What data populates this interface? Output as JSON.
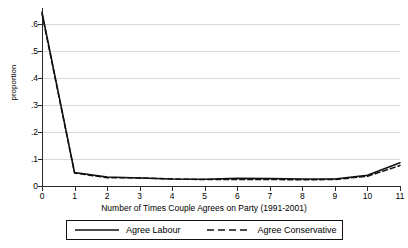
{
  "chart_data": {
    "type": "line",
    "title": "",
    "xlabel": "Number of Times Couple Agrees on Party (1991-2001)",
    "ylabel": "proportion",
    "x": [
      0,
      1,
      2,
      3,
      4,
      5,
      6,
      7,
      8,
      9,
      10,
      11
    ],
    "xlim": [
      0,
      11
    ],
    "ylim": [
      0,
      0.66
    ],
    "xticks": [
      "0",
      "1",
      "2",
      "3",
      "4",
      "5",
      "6",
      "7",
      "8",
      "9",
      "10",
      "11"
    ],
    "yticks": [
      "0",
      ".1",
      ".2",
      ".3",
      ".4",
      ".5",
      ".6"
    ],
    "ytick_values": [
      0,
      0.1,
      0.2,
      0.3,
      0.4,
      0.5,
      0.6
    ],
    "grid": "horizontal",
    "legend_position": "below-axis",
    "series": [
      {
        "name": "Agree Labour",
        "style": "solid",
        "color": "#111111",
        "values": [
          0.645,
          0.05,
          0.033,
          0.03,
          0.026,
          0.025,
          0.029,
          0.028,
          0.026,
          0.026,
          0.04,
          0.086
        ]
      },
      {
        "name": "Agree Conservative",
        "style": "dashed",
        "color": "#111111",
        "values": [
          0.638,
          0.048,
          0.031,
          0.03,
          0.026,
          0.024,
          0.024,
          0.024,
          0.023,
          0.024,
          0.036,
          0.076
        ]
      }
    ]
  },
  "legend": {
    "entries": [
      {
        "label": "Agree Labour",
        "style": "solid"
      },
      {
        "label": "Agree Conservative",
        "style": "dashed"
      }
    ]
  }
}
